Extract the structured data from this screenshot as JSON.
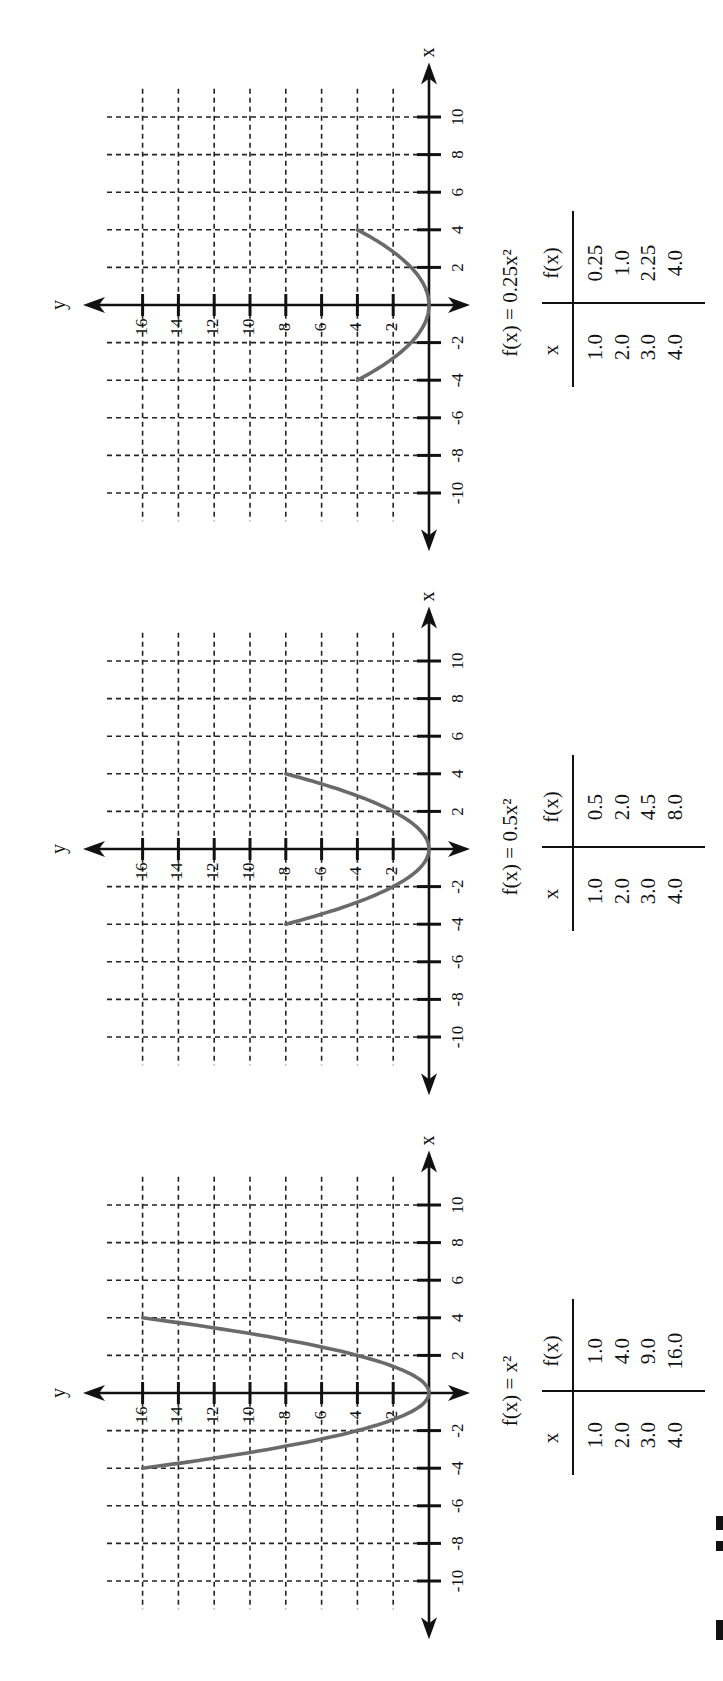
{
  "figure": {
    "axis_labels": {
      "x": "x",
      "y": "y"
    },
    "x_ticks": [
      -10,
      -8,
      -6,
      -4,
      -2,
      2,
      4,
      6,
      8,
      10
    ],
    "y_ticks": [
      2,
      4,
      6,
      8,
      10,
      12,
      14,
      16
    ],
    "colors": {
      "axis": "#111111",
      "grid": "#222222",
      "curve": "#6a6a6a",
      "background": "#ffffff"
    },
    "orientation": "page rotated 90 degrees counter-clockwise"
  },
  "panels": [
    {
      "title": "f(x) = 0.25x²",
      "coef": 0.25,
      "table": {
        "headers": [
          "x",
          "f(x)"
        ],
        "x": [
          "1.0",
          "2.0",
          "3.0",
          "4.0"
        ],
        "fx": [
          "0.25",
          "1.0",
          "2.25",
          "4.0"
        ]
      }
    },
    {
      "title": "f(x) = 0.5x²",
      "coef": 0.5,
      "table": {
        "headers": [
          "x",
          "f(x)"
        ],
        "x": [
          "1.0",
          "2.0",
          "3.0",
          "4.0"
        ],
        "fx": [
          "0.5",
          "2.0",
          "4.5",
          "8.0"
        ]
      }
    },
    {
      "title": "f(x) = x²",
      "coef": 1,
      "table": {
        "headers": [
          "x",
          "f(x)"
        ],
        "x": [
          "1.0",
          "2.0",
          "3.0",
          "4.0"
        ],
        "fx": [
          "1.0",
          "4.0",
          "9.0",
          "16.0"
        ]
      }
    }
  ],
  "chart_data": [
    {
      "type": "line",
      "title": "f(x) = 0.25x²",
      "xlabel": "x",
      "ylabel": "y",
      "xlim": [
        -10,
        10
      ],
      "ylim": [
        0,
        16
      ],
      "grid": true,
      "x": [
        -4,
        -3,
        -2,
        -1,
        0,
        1,
        2,
        3,
        4
      ],
      "series": [
        {
          "name": "f(x) = 0.25x²",
          "values": [
            4,
            2.25,
            1,
            0.25,
            0,
            0.25,
            1,
            2.25,
            4
          ]
        }
      ],
      "table": {
        "x": [
          1.0,
          2.0,
          3.0,
          4.0
        ],
        "fx": [
          0.25,
          1.0,
          2.25,
          4.0
        ]
      }
    },
    {
      "type": "line",
      "title": "f(x) = 0.5x²",
      "xlabel": "x",
      "ylabel": "y",
      "xlim": [
        -10,
        10
      ],
      "ylim": [
        0,
        16
      ],
      "grid": true,
      "x": [
        -4,
        -3,
        -2,
        -1,
        0,
        1,
        2,
        3,
        4
      ],
      "series": [
        {
          "name": "f(x) = 0.5x²",
          "values": [
            8,
            4.5,
            2,
            0.5,
            0,
            0.5,
            2,
            4.5,
            8
          ]
        }
      ],
      "table": {
        "x": [
          1.0,
          2.0,
          3.0,
          4.0
        ],
        "fx": [
          0.5,
          2.0,
          4.5,
          8.0
        ]
      }
    },
    {
      "type": "line",
      "title": "f(x) = x²",
      "xlabel": "x",
      "ylabel": "y",
      "xlim": [
        -10,
        10
      ],
      "ylim": [
        0,
        16
      ],
      "grid": true,
      "x": [
        -4,
        -3,
        -2,
        -1,
        0,
        1,
        2,
        3,
        4
      ],
      "series": [
        {
          "name": "f(x) = x²",
          "values": [
            16,
            9,
            4,
            1,
            0,
            1,
            4,
            9,
            16
          ]
        }
      ],
      "table": {
        "x": [
          1.0,
          2.0,
          3.0,
          4.0
        ],
        "fx": [
          1.0,
          4.0,
          9.0,
          16.0
        ]
      }
    }
  ]
}
